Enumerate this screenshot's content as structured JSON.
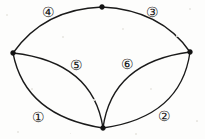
{
  "figure": {
    "kind": "planar-graph-diagram",
    "background_color": "#fdfdfc",
    "stroke_color": "#1a1a1a",
    "width": 205,
    "height": 139,
    "vertices": [
      {
        "id": "top",
        "name": "top-vertex",
        "x": 102,
        "y": 7,
        "radius": 2.4
      },
      {
        "id": "left",
        "name": "left-vertex",
        "x": 13,
        "y": 53,
        "radius": 2.4
      },
      {
        "id": "right",
        "name": "right-vertex",
        "x": 190,
        "y": 52,
        "radius": 2.4
      },
      {
        "id": "bottom",
        "name": "bottom-vertex",
        "x": 103,
        "y": 128,
        "radius": 2.4
      }
    ],
    "edges": [
      {
        "id": "e-top-left",
        "name": "edge-top-left",
        "from": "left",
        "to": "top",
        "path": "M 13 53 Q 44 9 102 7"
      },
      {
        "id": "e-top-right",
        "name": "edge-top-right",
        "from": "top",
        "to": "right",
        "path": "M 102 7 Q 161 10 190 52"
      },
      {
        "id": "e-bottom-left",
        "name": "edge-bottom-left-outer",
        "from": "left",
        "to": "bottom",
        "path": "M 13 53 Q 25 116 103 128"
      },
      {
        "id": "e-bottom-right",
        "name": "edge-bottom-right-outer",
        "from": "bottom",
        "to": "right",
        "path": "M 103 128 Q 181 117 190 52"
      },
      {
        "id": "e-inner-left",
        "name": "edge-inner-left",
        "from": "left",
        "to": "bottom",
        "path": "M 13 53 Q 93 62 103 128"
      },
      {
        "id": "e-inner-right",
        "name": "edge-inner-right",
        "from": "bottom",
        "to": "right",
        "path": "M 103 128 Q 112 62 190 52"
      }
    ],
    "labels": [
      {
        "id": "r1",
        "name": "region-label-1",
        "text": "①",
        "x": 38,
        "y": 118
      },
      {
        "id": "r2",
        "name": "region-label-2",
        "text": "②",
        "x": 164,
        "y": 117
      },
      {
        "id": "r3",
        "name": "region-label-3",
        "text": "③",
        "x": 152,
        "y": 13
      },
      {
        "id": "r4",
        "name": "region-label-4",
        "text": "④",
        "x": 48,
        "y": 13
      },
      {
        "id": "r5",
        "name": "region-label-5",
        "text": "⑤",
        "x": 76,
        "y": 66
      },
      {
        "id": "r6",
        "name": "region-label-6",
        "text": "⑥",
        "x": 127,
        "y": 65
      }
    ],
    "specks": [
      {
        "x": 6,
        "y": 14,
        "size": 2.0
      },
      {
        "x": 62,
        "y": 36,
        "size": 1.6
      },
      {
        "x": 122,
        "y": 28,
        "size": 1.8
      },
      {
        "x": 176,
        "y": 35,
        "size": 1.5
      },
      {
        "x": 31,
        "y": 88,
        "size": 1.7
      },
      {
        "x": 93,
        "y": 99,
        "size": 1.5
      },
      {
        "x": 150,
        "y": 88,
        "size": 1.8
      },
      {
        "x": 17,
        "y": 131,
        "size": 1.6
      },
      {
        "x": 196,
        "y": 120,
        "size": 1.7
      },
      {
        "x": 70,
        "y": 133,
        "size": 1.4
      },
      {
        "x": 135,
        "y": 133,
        "size": 1.5
      },
      {
        "x": 189,
        "y": 8,
        "size": 1.6
      }
    ]
  }
}
